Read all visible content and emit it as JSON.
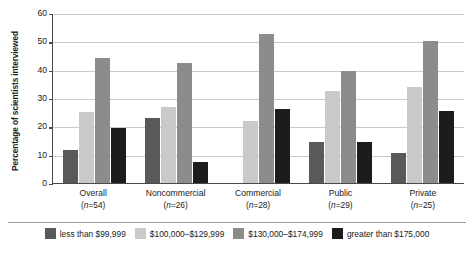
{
  "chart_data": {
    "type": "bar",
    "title": "",
    "xlabel": "",
    "ylabel": "Percentage of scientists interviewed",
    "ylim": [
      0,
      60
    ],
    "yticks": [
      0,
      10,
      20,
      30,
      40,
      50,
      60
    ],
    "grid": true,
    "legend_position": "bottom",
    "categories": [
      "Overall",
      "Noncommercial",
      "Commercial",
      "Public",
      "Private"
    ],
    "category_counts": [
      "(n=54)",
      "(n=26)",
      "(n=28)",
      "(n=29)",
      "(n=25)"
    ],
    "series": [
      {
        "name": "less than $99,999",
        "color": "#595959",
        "values": [
          11.5,
          23.0,
          0.0,
          14.5,
          10.5
        ]
      },
      {
        "name": "$100,000–$129,999",
        "color": "#c9c9c9",
        "values": [
          25.0,
          27.0,
          22.0,
          32.5,
          34.0
        ]
      },
      {
        "name": "$130,000–$174,999",
        "color": "#8c8c8c",
        "values": [
          44.0,
          42.5,
          52.5,
          39.5,
          50.0
        ]
      },
      {
        "name": "greater than $175,000",
        "color": "#1c1c1c",
        "values": [
          19.5,
          7.5,
          26.0,
          14.5,
          25.5
        ]
      }
    ]
  },
  "axis": {
    "y_title": "Percentage of scientists interviewed",
    "y_tick_labels": [
      "60",
      "50",
      "40",
      "30",
      "20",
      "10",
      "0"
    ]
  },
  "groups": [
    {
      "label": "Overall",
      "count": "(n=54)"
    },
    {
      "label": "Noncommercial",
      "count": "(n=26)"
    },
    {
      "label": "Commercial",
      "count": "(n=28)"
    },
    {
      "label": "Public",
      "count": "(n=29)"
    },
    {
      "label": "Private",
      "count": "(n=25)"
    }
  ],
  "legend": [
    {
      "label": "less than $99,999",
      "color": "#595959"
    },
    {
      "label": "$100,000–$129,999",
      "color": "#c9c9c9"
    },
    {
      "label": "$130,000–$174,999",
      "color": "#8c8c8c"
    },
    {
      "label": "greater than $175,000",
      "color": "#1c1c1c"
    }
  ]
}
